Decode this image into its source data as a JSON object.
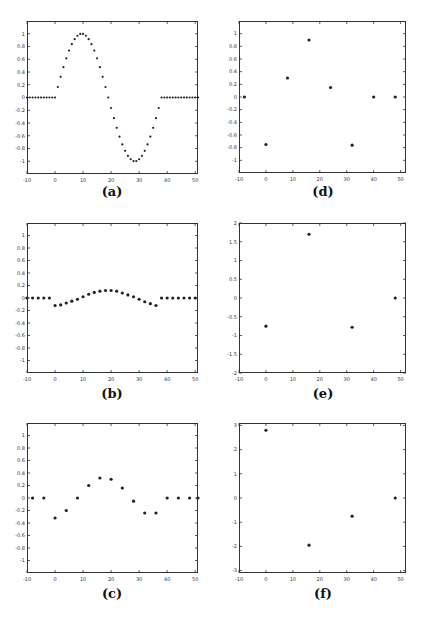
{
  "figure": {
    "panels": [
      {
        "id": "a",
        "caption": "(a)"
      },
      {
        "id": "b",
        "caption": "(b)"
      },
      {
        "id": "c",
        "caption": "(c)"
      },
      {
        "id": "d",
        "caption": "(d)"
      },
      {
        "id": "e",
        "caption": "(e)"
      },
      {
        "id": "f",
        "caption": "(f)"
      }
    ]
  },
  "chart_data": [
    {
      "id": "a",
      "type": "scatter",
      "title": "(a)",
      "xlabel": "",
      "ylabel": "",
      "xlim": [
        -10,
        51
      ],
      "ylim": [
        -1.2,
        1.2
      ],
      "xticks": [
        -10,
        0,
        10,
        20,
        30,
        40,
        50
      ],
      "yticks": [
        -1,
        -0.8,
        -0.6,
        -0.4,
        -0.2,
        0,
        0.2,
        0.4,
        0.6,
        0.8,
        1
      ],
      "ytick_labels": [
        "-1",
        "-0.8",
        "-0.6",
        "-0.4",
        "-0.2",
        "0",
        "0.2",
        "0.4",
        "0.6",
        "0.8",
        "1"
      ],
      "marker_size": 1.1,
      "x": [
        -10,
        -9,
        -8,
        -7,
        -6,
        -5,
        -4,
        -3,
        -2,
        -1,
        0,
        1,
        2,
        3,
        4,
        5,
        6,
        7,
        8,
        9,
        10,
        11,
        12,
        13,
        14,
        15,
        16,
        17,
        18,
        19,
        20,
        21,
        22,
        23,
        24,
        25,
        26,
        27,
        28,
        29,
        30,
        31,
        32,
        33,
        34,
        35,
        36,
        37,
        38,
        39,
        40,
        41,
        42,
        43,
        44,
        45,
        46,
        47,
        48,
        49,
        50,
        51
      ],
      "y": [
        0,
        0,
        0,
        0,
        0,
        0,
        0,
        0,
        0,
        0,
        0,
        0.165,
        0.325,
        0.476,
        0.614,
        0.736,
        0.837,
        0.915,
        0.969,
        0.997,
        0.997,
        0.969,
        0.915,
        0.837,
        0.736,
        0.614,
        0.476,
        0.325,
        0.165,
        0,
        -0.165,
        -0.325,
        -0.476,
        -0.614,
        -0.736,
        -0.837,
        -0.915,
        -0.969,
        -0.997,
        -0.997,
        -0.969,
        -0.915,
        -0.837,
        -0.736,
        -0.614,
        -0.476,
        -0.325,
        -0.165,
        0,
        0,
        0,
        0,
        0,
        0,
        0,
        0,
        0,
        0,
        0,
        0,
        0,
        0
      ]
    },
    {
      "id": "b",
      "type": "scatter",
      "title": "(b)",
      "xlabel": "",
      "ylabel": "",
      "xlim": [
        -10,
        51
      ],
      "ylim": [
        -1.2,
        1.2
      ],
      "xticks": [
        -10,
        0,
        10,
        20,
        30,
        40,
        50
      ],
      "yticks": [
        -1,
        -0.8,
        -0.6,
        -0.4,
        -0.2,
        0,
        0.2,
        0.4,
        0.6,
        0.8,
        1
      ],
      "ytick_labels": [
        "-1",
        "-0.8",
        "-0.6",
        "-0.4",
        "-0.2",
        "0",
        "0.2",
        "0.4",
        "0.6",
        "0.8",
        "1"
      ],
      "marker_size": 1.6,
      "x": [
        -10,
        -8,
        -6,
        -4,
        -2,
        0,
        2,
        4,
        6,
        8,
        10,
        12,
        14,
        16,
        18,
        20,
        22,
        24,
        26,
        28,
        30,
        32,
        34,
        36,
        38,
        40,
        42,
        44,
        46,
        48,
        50
      ],
      "y": [
        0,
        0,
        0,
        0,
        0,
        -0.12,
        -0.11,
        -0.08,
        -0.05,
        -0.02,
        0.02,
        0.06,
        0.09,
        0.11,
        0.12,
        0.12,
        0.11,
        0.08,
        0.05,
        0.02,
        -0.02,
        -0.06,
        -0.09,
        -0.12,
        0,
        0,
        0,
        0,
        0,
        0,
        0
      ]
    },
    {
      "id": "c",
      "type": "scatter",
      "title": "(c)",
      "xlabel": "",
      "ylabel": "",
      "xlim": [
        -10,
        51
      ],
      "ylim": [
        -1.2,
        1.2
      ],
      "xticks": [
        -10,
        0,
        10,
        20,
        30,
        40,
        50
      ],
      "yticks": [
        -1,
        -0.8,
        -0.6,
        -0.4,
        -0.2,
        0,
        0.2,
        0.4,
        0.6,
        0.8,
        1
      ],
      "ytick_labels": [
        "-1",
        "-0.8",
        "-0.6",
        "-0.4",
        "-0.2",
        "0",
        "0.2",
        "0.4",
        "0.6",
        "0.8",
        "1"
      ],
      "marker_size": 1.6,
      "x": [
        -8,
        -4,
        0,
        4,
        8,
        12,
        16,
        20,
        24,
        28,
        32,
        36,
        40,
        44,
        48,
        51
      ],
      "y": [
        0,
        0,
        -0.32,
        -0.2,
        0,
        0.2,
        0.32,
        0.3,
        0.16,
        -0.05,
        -0.24,
        -0.24,
        0,
        0,
        0,
        0
      ]
    },
    {
      "id": "d",
      "type": "scatter",
      "title": "(d)",
      "xlabel": "",
      "ylabel": "",
      "xlim": [
        -10,
        52
      ],
      "ylim": [
        -1.2,
        1.2
      ],
      "xticks": [
        -10,
        0,
        10,
        20,
        30,
        40,
        50
      ],
      "yticks": [
        -1,
        -0.8,
        -0.6,
        -0.4,
        -0.2,
        0,
        0.2,
        0.4,
        0.6,
        0.8,
        1
      ],
      "ytick_labels": [
        "-1",
        "-0.8",
        "-0.6",
        "-0.4",
        "-0.2",
        "0",
        "0.2",
        "0.4",
        "0.6",
        "0.8",
        "1"
      ],
      "marker_size": 1.6,
      "x": [
        -8,
        0,
        8,
        16,
        24,
        32,
        40,
        48
      ],
      "y": [
        0,
        -0.75,
        0.3,
        0.9,
        0.15,
        -0.76,
        0,
        0
      ]
    },
    {
      "id": "e",
      "type": "scatter",
      "title": "(e)",
      "xlabel": "",
      "ylabel": "",
      "xlim": [
        -10,
        52
      ],
      "ylim": [
        -2,
        2
      ],
      "xticks": [
        -10,
        0,
        10,
        20,
        30,
        40,
        50
      ],
      "yticks": [
        -2,
        -1.5,
        -1,
        -0.5,
        0,
        0.5,
        1,
        1.5,
        2
      ],
      "ytick_labels": [
        "-2",
        "-1.5",
        "-1",
        "-0.5",
        "0",
        "0.5",
        "1",
        "1.5",
        "2"
      ],
      "marker_size": 1.6,
      "x": [
        0,
        16,
        32,
        48
      ],
      "y": [
        -0.75,
        1.7,
        -0.78,
        0
      ]
    },
    {
      "id": "f",
      "type": "scatter",
      "title": "(f)",
      "xlabel": "",
      "ylabel": "",
      "xlim": [
        -10,
        52
      ],
      "ylim": [
        -3.1,
        3.1
      ],
      "xticks": [
        -10,
        0,
        10,
        20,
        30,
        40,
        50
      ],
      "yticks": [
        -3,
        -2,
        -1,
        0,
        1,
        2,
        3
      ],
      "ytick_labels": [
        "-3",
        "-2",
        "-1",
        "0",
        "1",
        "2",
        "3"
      ],
      "marker_size": 1.6,
      "x": [
        0,
        16,
        32,
        48
      ],
      "y": [
        2.8,
        -1.95,
        -0.75,
        0
      ]
    }
  ]
}
